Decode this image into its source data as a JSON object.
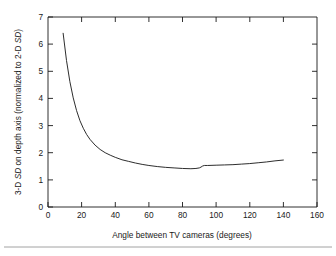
{
  "figure": {
    "background_color": "#ffffff",
    "line_color": "#222222",
    "axis_color": "#1a1a1a",
    "rule_color": "#8a8a8a"
  },
  "axis_titles": {
    "x": "Angle between TV cameras (degrees)",
    "y_part1": "3-D ",
    "y_part2": "SD",
    "y_part3": " on depth axis (normalized to 2-D ",
    "y_part4": "SD",
    "y_part5": ")",
    "y_full": "3-D SD on depth axis (normalized to 2-D SD)"
  },
  "ticks": {
    "x_labels": [
      "0",
      "20",
      "40",
      "60",
      "80",
      "100",
      "120",
      "140",
      "160"
    ],
    "y_labels": [
      "0",
      "1",
      "2",
      "3",
      "4",
      "5",
      "6",
      "7"
    ]
  },
  "chart_data": {
    "type": "line",
    "title": "",
    "xlabel": "Angle between TV cameras (degrees)",
    "ylabel": "3-D SD on depth axis (normalized to 2-D SD)",
    "xlim": [
      0,
      160
    ],
    "ylim": [
      0,
      7
    ],
    "xticks": [
      0,
      20,
      40,
      60,
      80,
      100,
      120,
      140,
      160
    ],
    "yticks": [
      0,
      1,
      2,
      3,
      4,
      5,
      6,
      7
    ],
    "grid": false,
    "legend": "none",
    "series": [
      {
        "name": "3-D SD on depth axis",
        "x": [
          9,
          11,
          13,
          15,
          17,
          19,
          21,
          23,
          25,
          28,
          31,
          34,
          37,
          40,
          44,
          48,
          52,
          56,
          60,
          65,
          70,
          75,
          80,
          85,
          88,
          90,
          91,
          92,
          93,
          95,
          100,
          105,
          110,
          115,
          120,
          125,
          130,
          135,
          140
        ],
        "y": [
          6.4,
          5.4,
          4.62,
          4.02,
          3.55,
          3.18,
          2.9,
          2.67,
          2.49,
          2.28,
          2.12,
          2.0,
          1.91,
          1.83,
          1.74,
          1.68,
          1.62,
          1.57,
          1.53,
          1.49,
          1.46,
          1.44,
          1.42,
          1.41,
          1.42,
          1.44,
          1.47,
          1.51,
          1.53,
          1.53,
          1.54,
          1.55,
          1.56,
          1.58,
          1.6,
          1.63,
          1.66,
          1.7,
          1.73
        ]
      }
    ],
    "annotations": [
      {
        "text": "minimum near 85 degrees at about 1.41"
      },
      {
        "text": "small step discontinuity near 92 degrees"
      }
    ]
  }
}
